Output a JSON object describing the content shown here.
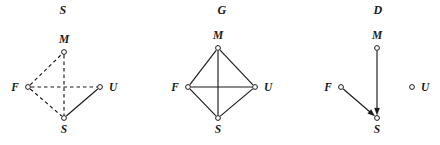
{
  "figure": {
    "background_color": "#ffffff",
    "ink_color": "#1a1a1a",
    "width": 440,
    "height": 145
  },
  "panels": [
    {
      "id": "s",
      "title": "S",
      "graph_type": "undirected",
      "nodes": [
        {
          "id": "M",
          "label": "M",
          "x": 64,
          "y": 52,
          "label_dx": 0,
          "label_dy": -9,
          "label_anchor": "middle"
        },
        {
          "id": "F",
          "label": "F",
          "x": 28,
          "y": 87,
          "label_dx": -9,
          "label_dy": 4,
          "label_anchor": "end"
        },
        {
          "id": "U",
          "label": "U",
          "x": 100,
          "y": 87,
          "label_dx": 9,
          "label_dy": 4,
          "label_anchor": "start"
        },
        {
          "id": "S",
          "label": "S",
          "x": 64,
          "y": 118,
          "label_dx": 0,
          "label_dy": 15,
          "label_anchor": "middle"
        }
      ],
      "edges": [
        {
          "from": "F",
          "to": "M",
          "style": "dashed"
        },
        {
          "from": "F",
          "to": "U",
          "style": "dashed"
        },
        {
          "from": "F",
          "to": "S",
          "style": "dashed"
        },
        {
          "from": "M",
          "to": "S",
          "style": "dashed"
        },
        {
          "from": "U",
          "to": "S",
          "style": "solid"
        }
      ]
    },
    {
      "id": "g",
      "title": "G",
      "graph_type": "undirected",
      "nodes": [
        {
          "id": "M",
          "label": "M",
          "x": 70,
          "y": 48,
          "label_dx": 0,
          "label_dy": -9,
          "label_anchor": "middle"
        },
        {
          "id": "F",
          "label": "F",
          "x": 40,
          "y": 87,
          "label_dx": -9,
          "label_dy": 4,
          "label_anchor": "end"
        },
        {
          "id": "U",
          "label": "U",
          "x": 107,
          "y": 87,
          "label_dx": 9,
          "label_dy": 4,
          "label_anchor": "start"
        },
        {
          "id": "S",
          "label": "S",
          "x": 70,
          "y": 118,
          "label_dx": 0,
          "label_dy": 15,
          "label_anchor": "middle"
        }
      ],
      "edges": [
        {
          "from": "F",
          "to": "M",
          "style": "solid"
        },
        {
          "from": "M",
          "to": "U",
          "style": "solid"
        },
        {
          "from": "U",
          "to": "S",
          "style": "solid"
        },
        {
          "from": "S",
          "to": "F",
          "style": "solid"
        },
        {
          "from": "F",
          "to": "U",
          "style": "solid"
        },
        {
          "from": "M",
          "to": "S",
          "style": "solid"
        }
      ]
    },
    {
      "id": "d",
      "title": "D",
      "graph_type": "directed",
      "nodes": [
        {
          "id": "M",
          "label": "M",
          "x": 83,
          "y": 48,
          "label_dx": 0,
          "label_dy": -9,
          "label_anchor": "middle"
        },
        {
          "id": "F",
          "label": "F",
          "x": 47,
          "y": 87,
          "label_dx": -9,
          "label_dy": 4,
          "label_anchor": "end"
        },
        {
          "id": "U",
          "label": "U",
          "x": 118,
          "y": 87,
          "label_dx": 9,
          "label_dy": 4,
          "label_anchor": "start"
        },
        {
          "id": "S",
          "label": "S",
          "x": 83,
          "y": 118,
          "label_dx": 0,
          "label_dy": 15,
          "label_anchor": "middle"
        }
      ],
      "edges": [
        {
          "from": "M",
          "to": "S",
          "style": "solid",
          "directed": true
        },
        {
          "from": "F",
          "to": "S",
          "style": "solid",
          "directed": true
        }
      ]
    }
  ],
  "style": {
    "node_radius": 2.4,
    "node_fill": "#ffffff",
    "node_stroke": "#1a1a1a",
    "node_stroke_width": 1,
    "edge_width": 1.15,
    "dash_pattern": "3.5,3",
    "arrow_length": 7,
    "arrow_half_width": 2.6
  }
}
